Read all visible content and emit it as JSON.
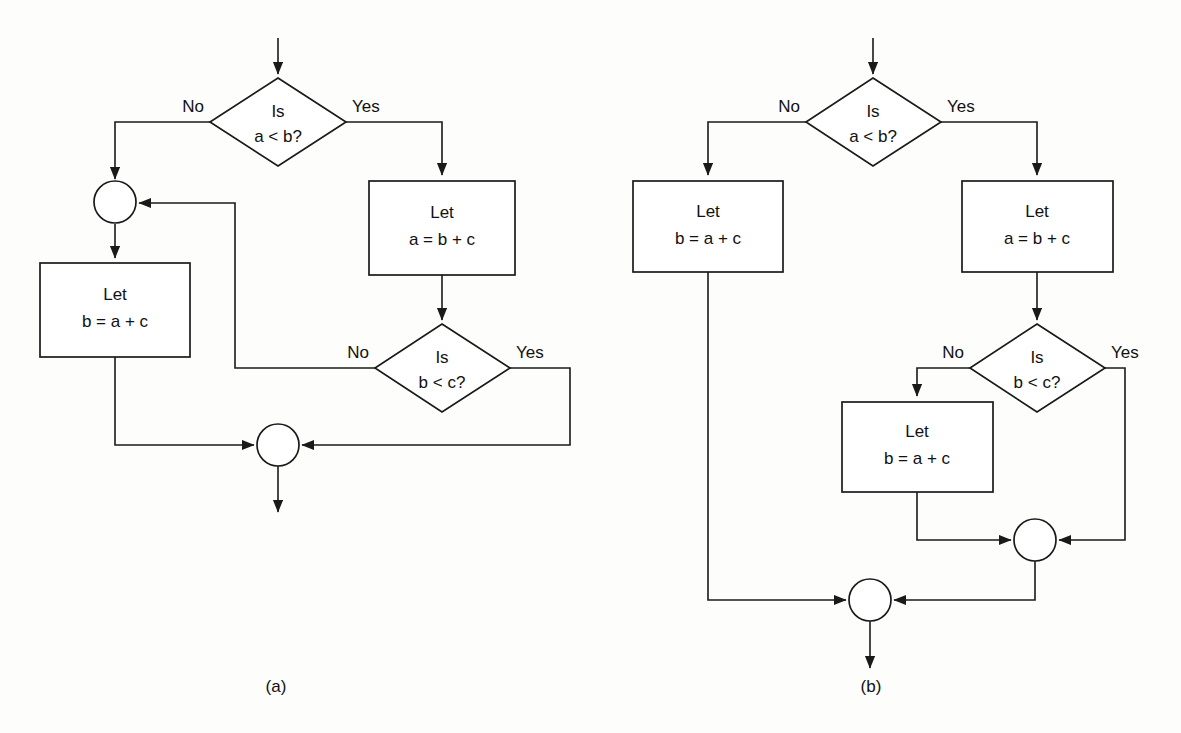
{
  "figure": {
    "type": "flowchart-pair",
    "background_color": "#fdfdfb",
    "line_color": "#1a1a1a",
    "shape_fill": "#ffffff"
  },
  "captions": {
    "a": "(a)",
    "b": "(b)"
  },
  "diagram_a": {
    "caption": "(a)",
    "decision_1": {
      "line1": "Is",
      "line2": "a < b?"
    },
    "decision_1_no": "No",
    "decision_1_yes": "Yes",
    "process_right": {
      "line1": "Let",
      "line2": "a = b + c"
    },
    "process_left": {
      "line1": "Let",
      "line2": "b = a + c"
    },
    "decision_2": {
      "line1": "Is",
      "line2": "b < c?"
    },
    "decision_2_no": "No",
    "decision_2_yes": "Yes"
  },
  "diagram_b": {
    "caption": "(b)",
    "decision_1": {
      "line1": "Is",
      "line2": "a < b?"
    },
    "decision_1_no": "No",
    "decision_1_yes": "Yes",
    "process_left": {
      "line1": "Let",
      "line2": "b = a + c"
    },
    "process_right": {
      "line1": "Let",
      "line2": "a = b + c"
    },
    "decision_2": {
      "line1": "Is",
      "line2": "b < c?"
    },
    "decision_2_no": "No",
    "decision_2_yes": "Yes",
    "process_lower": {
      "line1": "Let",
      "line2": "b = a + c"
    }
  }
}
